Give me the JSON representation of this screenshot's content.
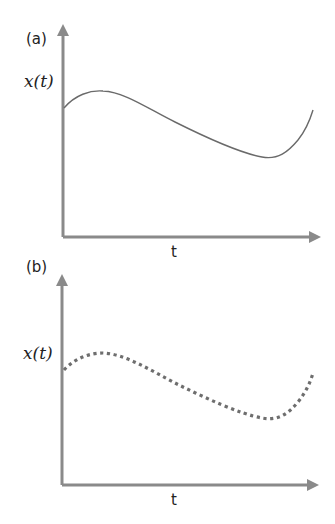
{
  "panels": [
    {
      "id": "a",
      "label": "(a)",
      "y_axis_label": "x(t)",
      "x_axis_label": "t",
      "line_style": "solid"
    },
    {
      "id": "b",
      "label": "(b)",
      "y_axis_label": "x(t)",
      "x_axis_label": "t",
      "line_style": "dotted"
    }
  ],
  "colors": {
    "axis": "#8a8a8a",
    "curve_a": "#6a6a6a",
    "curve_b": "#6e6e6e",
    "text": "#222222"
  }
}
